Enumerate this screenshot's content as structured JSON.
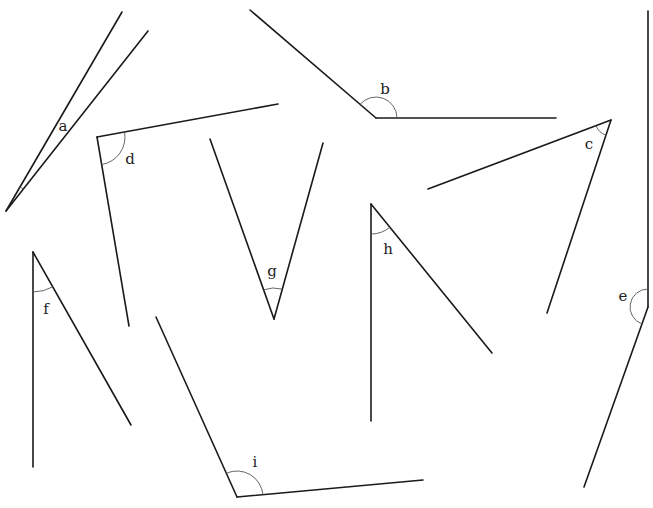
{
  "diagram": {
    "title": "",
    "width": 653,
    "height": 508,
    "angles": [
      {
        "label": "a",
        "vertex": [
          6,
          211
        ],
        "ray1": [
          122,
          12
        ],
        "ray2": [
          148,
          31
        ],
        "arc_radius": 28,
        "label_pos": [
          63,
          131
        ]
      },
      {
        "label": "b",
        "vertex": [
          376,
          118
        ],
        "ray1": [
          250,
          10
        ],
        "ray2": [
          556,
          118
        ],
        "arc_radius": 21,
        "label_pos": [
          385,
          94
        ]
      },
      {
        "label": "c",
        "vertex": [
          611,
          120
        ],
        "ray1": [
          428,
          189
        ],
        "ray2": [
          547,
          313
        ],
        "arc_radius": 16,
        "label_pos": [
          589,
          149
        ]
      },
      {
        "label": "d",
        "vertex": [
          97,
          137
        ],
        "ray1": [
          278,
          104
        ],
        "ray2": [
          129,
          326
        ],
        "arc_radius": 28,
        "label_pos": [
          130,
          164
        ]
      },
      {
        "label": "e",
        "vertex": [
          648,
          307
        ],
        "ray1": [
          648,
          11
        ],
        "ray2": [
          584,
          487
        ],
        "arc_radius": 18,
        "label_pos": [
          623,
          301
        ]
      },
      {
        "label": "f",
        "vertex": [
          33,
          252
        ],
        "ray1": [
          33,
          467
        ],
        "ray2": [
          131,
          425
        ],
        "arc_radius": 40,
        "label_pos": [
          46,
          314
        ]
      },
      {
        "label": "g",
        "vertex": [
          274,
          319
        ],
        "ray1": [
          210,
          139
        ],
        "ray2": [
          323,
          143
        ],
        "arc_radius": 31,
        "label_pos": [
          272,
          276
        ]
      },
      {
        "label": "h",
        "vertex": [
          371,
          204
        ],
        "ray1": [
          371,
          421
        ],
        "ray2": [
          492,
          353
        ],
        "arc_radius": 30,
        "label_pos": [
          388,
          254
        ]
      },
      {
        "label": "i",
        "vertex": [
          237,
          497
        ],
        "ray1": [
          156,
          317
        ],
        "ray2": [
          423,
          480
        ],
        "arc_radius": 26,
        "label_pos": [
          255,
          467
        ]
      }
    ]
  }
}
